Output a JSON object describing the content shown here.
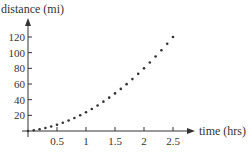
{
  "chart_data": {
    "type": "scatter",
    "title": "",
    "xlabel": "time (hrs)",
    "ylabel": "distance (mi)",
    "x_ticks": [
      0.5,
      1,
      1.5,
      2,
      2.5
    ],
    "x_tick_labels": [
      "0.5",
      "1",
      "1.5",
      "2",
      "2.5"
    ],
    "y_ticks": [
      20,
      40,
      60,
      80,
      100,
      120
    ],
    "y_tick_labels": [
      "20",
      "40",
      "60",
      "80",
      "100",
      "120"
    ],
    "xlim": [
      0,
      2.75
    ],
    "ylim": [
      0,
      140
    ],
    "grid": false,
    "legend": null,
    "series": [
      {
        "name": "distance",
        "x": [
          0,
          0.1,
          0.2,
          0.3,
          0.4,
          0.5,
          0.6,
          0.7,
          0.8,
          0.9,
          1.0,
          1.1,
          1.2,
          1.3,
          1.4,
          1.5,
          1.6,
          1.7,
          1.8,
          1.9,
          2.0,
          2.1,
          2.2,
          2.3,
          2.4,
          2.5
        ],
        "y": [
          0,
          0.96,
          2.24,
          3.84,
          5.76,
          8,
          10.56,
          13.44,
          16.64,
          20.16,
          24,
          28.16,
          32.64,
          37.44,
          42.56,
          48,
          53.76,
          59.84,
          66.24,
          72.96,
          80,
          87.36,
          95.04,
          103.04,
          111.36,
          120
        ]
      }
    ],
    "colors": {
      "axis": "#333333",
      "points": "#333333"
    }
  }
}
